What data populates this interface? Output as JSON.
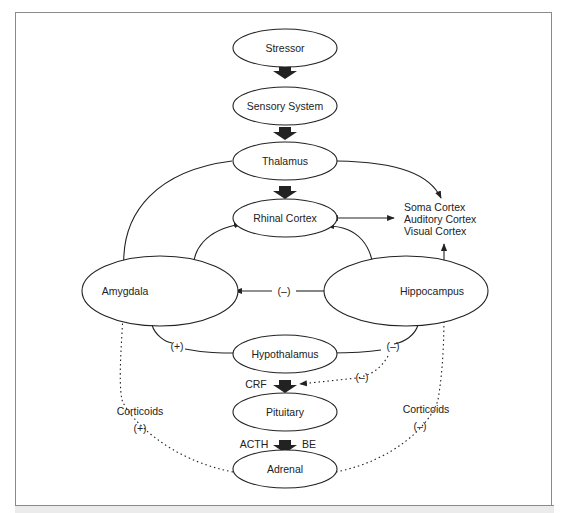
{
  "diagram": {
    "nodes": [
      {
        "id": "stressor",
        "label": "Stressor"
      },
      {
        "id": "sensory",
        "label": "Sensory System"
      },
      {
        "id": "thalamus",
        "label": "Thalamus"
      },
      {
        "id": "rhinal",
        "label": "Rhinal Cortex"
      },
      {
        "id": "amygdala",
        "label": "Amygdala"
      },
      {
        "id": "hippocampus",
        "label": "Hippocampus"
      },
      {
        "id": "hypothalamus",
        "label": "Hypothalamus"
      },
      {
        "id": "pituitary",
        "label": "Pituitary"
      },
      {
        "id": "adrenal",
        "label": "Adrenal"
      }
    ],
    "cortex_labels": [
      "Soma Cortex",
      "Auditory Cortex",
      "Visual Cortex"
    ],
    "edge_labels": {
      "hippo_to_amyg": "(–)",
      "amyg_to_hypo": "(+)",
      "hippo_to_hypo": "(–)",
      "hippo_to_crf": "(–)",
      "crf": "CRF",
      "acth": "ACTH",
      "be": "BE",
      "corticoids_left": "Corticoids",
      "corticoids_left_sign": "(+)",
      "corticoids_right": "Corticoids",
      "corticoids_right_sign": "(–)"
    }
  }
}
